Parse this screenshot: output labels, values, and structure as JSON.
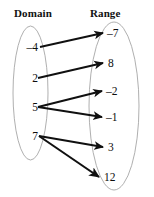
{
  "figure": {
    "type": "mapping-diagram",
    "headers": {
      "domain": "Domain",
      "range": "Range"
    },
    "domain_values": [
      "–4",
      "2",
      "5",
      "7"
    ],
    "range_values": [
      "–7",
      "8",
      "–2",
      "–1",
      "3",
      "12"
    ],
    "mappings": [
      {
        "from": "–4",
        "to": "–7"
      },
      {
        "from": "2",
        "to": "8"
      },
      {
        "from": "5",
        "to": "–2"
      },
      {
        "from": "5",
        "to": "–1"
      },
      {
        "from": "7",
        "to": "3"
      },
      {
        "from": "7",
        "to": "12"
      }
    ],
    "colors": {
      "ink": "#0d0d0d",
      "ellipse_stroke": "#9a9a9a",
      "arrow": "#101010",
      "background": "#ffffff"
    }
  }
}
